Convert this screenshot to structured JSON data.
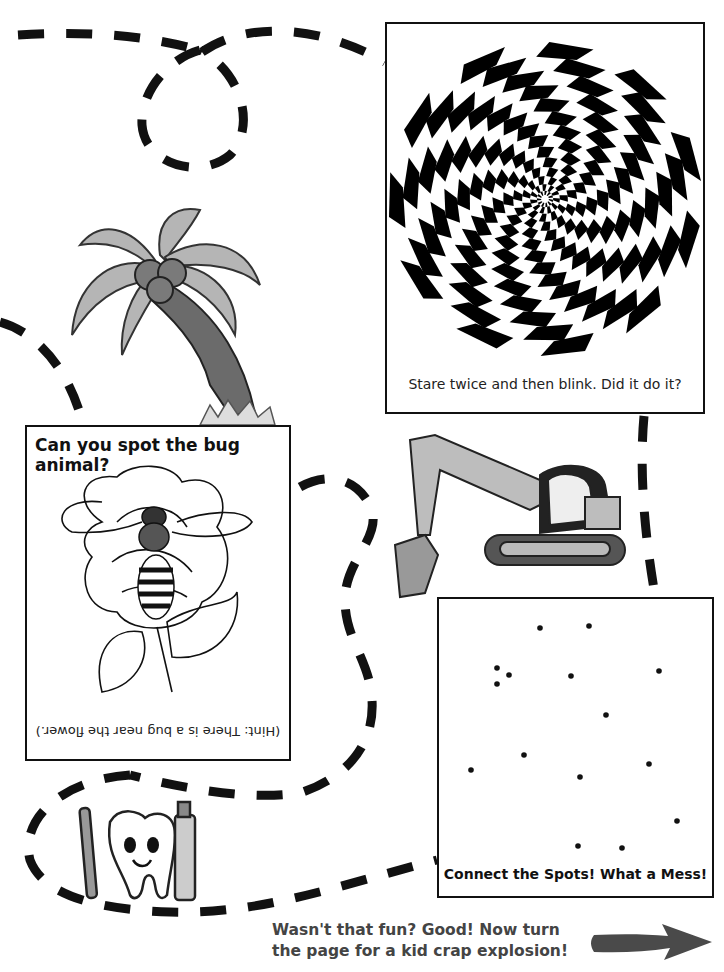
{
  "puzzles": {
    "spiral": {
      "caption": "Stare twice and then blink. Did it do it?",
      "image": "black-and-white-zigzag-spiral-illusion"
    },
    "bug": {
      "title": "Can you spot the bug animal?",
      "hint": "(Hint: There is a bug near the flower.)",
      "image": "bee-on-rose-line-drawing"
    },
    "dots": {
      "caption": "Connect the Spots! What a Mess!",
      "points": [
        [
          540,
          628
        ],
        [
          589,
          626
        ],
        [
          497,
          668
        ],
        [
          509,
          675
        ],
        [
          497,
          684
        ],
        [
          571,
          676
        ],
        [
          659,
          671
        ],
        [
          606,
          715
        ],
        [
          524,
          755
        ],
        [
          471,
          770
        ],
        [
          580,
          777
        ],
        [
          649,
          764
        ],
        [
          677,
          821
        ],
        [
          622,
          848
        ],
        [
          578,
          846
        ]
      ]
    }
  },
  "illustrations": {
    "palm_tree": "palm-tree",
    "excavator": "excavator",
    "tooth": "smiling-tooth-with-toothbrush-and-toothpaste"
  },
  "footer": {
    "line1": "Wasn't that fun? Good! Now turn",
    "line2": "the page for a kid crap explosion!",
    "arrow": "right-arrow-icon"
  },
  "colors": {
    "ink": "#111111",
    "gray_text": "#444444",
    "arrow": "#4a4a4a",
    "palm_leaf": "#b5b5b5",
    "palm_trunk": "#6b6b6b",
    "excavator_body": "#bdbdbd"
  }
}
